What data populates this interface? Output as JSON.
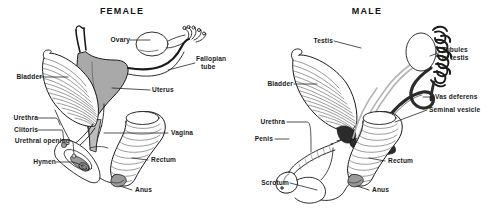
{
  "figure": {
    "kind": "anatomical-line-diagram",
    "background_color": "#ffffff",
    "ink_color": "#1a1a1a",
    "organ_fill_gray": "#a9a9a9",
    "organ_fill_dark": "#2b2b2b"
  },
  "panels": [
    {
      "id": "female",
      "title": "FEMALE",
      "labels": [
        {
          "name": "ovary",
          "text": "Ovary"
        },
        {
          "name": "fallopian-tube",
          "text_line1": "Fallopian",
          "text_line2": "tube"
        },
        {
          "name": "uterus",
          "text": "Uterus"
        },
        {
          "name": "bladder",
          "text": "Bladder"
        },
        {
          "name": "urethra",
          "text": "Urethra"
        },
        {
          "name": "clitoris",
          "text": "Clitoris"
        },
        {
          "name": "urethral-opening",
          "text": "Urethral opening"
        },
        {
          "name": "hymen",
          "text": "Hymen"
        },
        {
          "name": "vagina",
          "text": "Vagina"
        },
        {
          "name": "rectum",
          "text": "Rectum"
        },
        {
          "name": "anus",
          "text": "Anus"
        }
      ]
    },
    {
      "id": "male",
      "title": "MALE",
      "labels": [
        {
          "name": "testis",
          "text": "Testis"
        },
        {
          "name": "tubules-of-testis",
          "text_line1": "Tubules",
          "text_line2": "of testis"
        },
        {
          "name": "vas-deferens",
          "text": "Vas deferens"
        },
        {
          "name": "seminal-vesicle",
          "text": "Seminal vesicle"
        },
        {
          "name": "bladder",
          "text": "Bladder"
        },
        {
          "name": "urethra",
          "text": "Urethra"
        },
        {
          "name": "penis",
          "text": "Penis"
        },
        {
          "name": "scrotum",
          "text": "Scrotum"
        },
        {
          "name": "rectum",
          "text": "Rectum"
        },
        {
          "name": "anus",
          "text": "Anus"
        }
      ]
    }
  ]
}
